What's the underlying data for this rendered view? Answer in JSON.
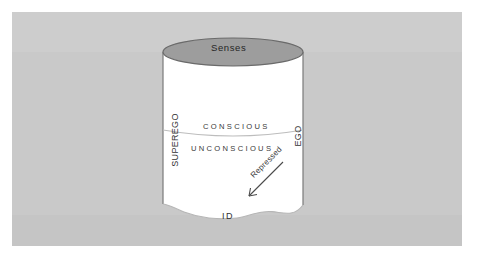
{
  "diagram": {
    "type": "cylinder-cross-section",
    "background_color": "#ffffff",
    "panel_color": "#c9c9c9",
    "cylinder_fill": "#ffffff",
    "top_ellipse_fill": "#9d9d9d",
    "outline_color": "#6e6e6e",
    "text_color": "#333333",
    "labels": {
      "senses": "Senses",
      "superego": "SUPEREGO",
      "ego": "EGO",
      "conscious": "CONSCIOUS",
      "unconscious": "UNCONSCIOUS",
      "repressed": "Repressed",
      "id": "ID"
    },
    "regions": [
      {
        "name": "senses",
        "label": "Senses",
        "position": "top-ellipse"
      },
      {
        "name": "conscious",
        "label": "CONSCIOUS",
        "position": "upper-band"
      },
      {
        "name": "unconscious",
        "label": "UNCONSCIOUS",
        "position": "middle-band"
      },
      {
        "name": "id",
        "label": "ID",
        "position": "bottom-ragged"
      },
      {
        "name": "superego",
        "label": "SUPEREGO",
        "position": "left-wall-vertical"
      },
      {
        "name": "ego",
        "label": "EGO",
        "position": "right-wall-vertical"
      }
    ],
    "annotations": [
      {
        "name": "repressed-arrow",
        "label": "Repressed",
        "direction": "down-left",
        "angle_degrees": 225
      }
    ]
  }
}
